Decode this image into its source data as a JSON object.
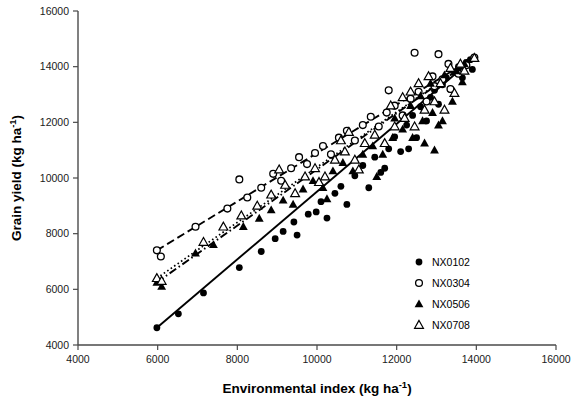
{
  "chart_data": {
    "type": "scatter",
    "title": "",
    "xlabel": "Environmental index (kg ha-1)",
    "xlabel_base": "Environmental index (kg ha",
    "xlabel_sup": "-1",
    "xlabel_tail": ")",
    "ylabel": "Grain yield  (kg ha-1)",
    "ylabel_base": "Grain yield  (kg ha",
    "ylabel_sup": "-1",
    "ylabel_tail": ")",
    "xlim": [
      4000,
      16000
    ],
    "ylim": [
      4000,
      16000
    ],
    "xticks": [
      4000,
      6000,
      8000,
      10000,
      12000,
      14000,
      16000
    ],
    "yticks": [
      4000,
      6000,
      8000,
      10000,
      12000,
      14000,
      16000
    ],
    "xtick_labels": [
      "4000",
      "6000",
      "8000",
      "10000",
      "12000",
      "14000",
      "16000"
    ],
    "ytick_labels": [
      "4000",
      "6000",
      "8000",
      "10000",
      "12000",
      "14000",
      "16000"
    ],
    "grid": false,
    "legend_position": "lower-right",
    "series": [
      {
        "name": "NX0102",
        "marker": "filled-circle",
        "line_style": "solid",
        "fit_line": {
          "x": [
            5980,
            13950
          ],
          "y": [
            4620,
            14320
          ]
        },
        "points": [
          [
            5980,
            4620
          ],
          [
            6520,
            5120
          ],
          [
            7150,
            5870
          ],
          [
            8050,
            6780
          ],
          [
            8600,
            7360
          ],
          [
            8950,
            7820
          ],
          [
            9150,
            8080
          ],
          [
            9420,
            8420
          ],
          [
            9500,
            7950
          ],
          [
            9780,
            8700
          ],
          [
            9980,
            8780
          ],
          [
            10100,
            9150
          ],
          [
            10250,
            8560
          ],
          [
            10450,
            9450
          ],
          [
            10600,
            9700
          ],
          [
            10750,
            9050
          ],
          [
            10950,
            10080
          ],
          [
            11150,
            10450
          ],
          [
            11300,
            9650
          ],
          [
            11450,
            10750
          ],
          [
            11600,
            10200
          ],
          [
            11800,
            11050
          ],
          [
            11950,
            11480
          ],
          [
            12100,
            10950
          ],
          [
            12250,
            11900
          ],
          [
            12400,
            12250
          ],
          [
            12500,
            11450
          ],
          [
            12600,
            12560
          ],
          [
            12750,
            12050
          ],
          [
            12850,
            12900
          ],
          [
            12950,
            13150
          ],
          [
            13050,
            12650
          ],
          [
            13150,
            13350
          ],
          [
            13250,
            13600
          ],
          [
            13350,
            13180
          ],
          [
            13450,
            13800
          ],
          [
            13550,
            14000
          ],
          [
            13650,
            13600
          ],
          [
            13750,
            14150
          ],
          [
            13850,
            14250
          ],
          [
            13950,
            14320
          ],
          [
            13900,
            13900
          ],
          [
            12300,
            11050
          ],
          [
            11700,
            10350
          ]
        ]
      },
      {
        "name": "NX0304",
        "marker": "open-circle",
        "line_style": "dashed",
        "fit_line": {
          "x": [
            5980,
            13950
          ],
          "y": [
            7400,
            14330
          ]
        },
        "points": [
          [
            5980,
            7400
          ],
          [
            6080,
            7180
          ],
          [
            6950,
            8250
          ],
          [
            7750,
            8900
          ],
          [
            8050,
            9950
          ],
          [
            8250,
            9300
          ],
          [
            8600,
            9650
          ],
          [
            8900,
            10150
          ],
          [
            9100,
            9900
          ],
          [
            9350,
            10350
          ],
          [
            9550,
            10750
          ],
          [
            9750,
            10500
          ],
          [
            9950,
            10900
          ],
          [
            10150,
            11150
          ],
          [
            10350,
            10850
          ],
          [
            10550,
            11450
          ],
          [
            10750,
            11700
          ],
          [
            10950,
            11350
          ],
          [
            11150,
            11900
          ],
          [
            11350,
            12200
          ],
          [
            11550,
            11850
          ],
          [
            11750,
            12350
          ],
          [
            11950,
            12600
          ],
          [
            12150,
            12250
          ],
          [
            12350,
            12850
          ],
          [
            12550,
            13100
          ],
          [
            12750,
            12750
          ],
          [
            12950,
            13300
          ],
          [
            13150,
            13550
          ],
          [
            13350,
            13200
          ],
          [
            13550,
            13750
          ],
          [
            13750,
            14050
          ],
          [
            13950,
            14330
          ],
          [
            12450,
            14500
          ],
          [
            13050,
            14450
          ],
          [
            11800,
            13150
          ],
          [
            12900,
            13650
          ],
          [
            13300,
            14100
          ]
        ]
      },
      {
        "name": "NX0506",
        "marker": "filled-triangle",
        "line_style": "dashdot",
        "fit_line": {
          "x": [
            5980,
            13950
          ],
          "y": [
            6250,
            14300
          ]
        },
        "points": [
          [
            5980,
            6250
          ],
          [
            6100,
            6100
          ],
          [
            6950,
            7300
          ],
          [
            7400,
            7600
          ],
          [
            8150,
            8250
          ],
          [
            8550,
            8550
          ],
          [
            8850,
            8850
          ],
          [
            9150,
            9200
          ],
          [
            9400,
            9050
          ],
          [
            9650,
            9600
          ],
          [
            9900,
            9900
          ],
          [
            10150,
            9650
          ],
          [
            10400,
            10250
          ],
          [
            10650,
            10550
          ],
          [
            10900,
            10250
          ],
          [
            11150,
            10850
          ],
          [
            11400,
            11150
          ],
          [
            11650,
            10850
          ],
          [
            11900,
            11450
          ],
          [
            12150,
            11750
          ],
          [
            12400,
            11450
          ],
          [
            12650,
            12050
          ],
          [
            12900,
            12350
          ],
          [
            13150,
            12050
          ],
          [
            13400,
            12750
          ],
          [
            13650,
            13450
          ],
          [
            13950,
            14300
          ],
          [
            11500,
            10050
          ],
          [
            12600,
            12950
          ],
          [
            12850,
            13400
          ],
          [
            13200,
            13700
          ],
          [
            13500,
            13850
          ],
          [
            13700,
            14100
          ],
          [
            12350,
            12600
          ],
          [
            11950,
            12150
          ],
          [
            10250,
            9250
          ],
          [
            12700,
            11250
          ],
          [
            13050,
            11900
          ],
          [
            12950,
            11000
          ]
        ]
      },
      {
        "name": "NX0708",
        "marker": "open-triangle",
        "line_style": "dotted",
        "fit_line": {
          "x": [
            5980,
            13950
          ],
          "y": [
            6400,
            14310
          ]
        },
        "points": [
          [
            5980,
            6400
          ],
          [
            6100,
            6300
          ],
          [
            7150,
            7700
          ],
          [
            7650,
            8250
          ],
          [
            8100,
            8650
          ],
          [
            8500,
            9000
          ],
          [
            8850,
            9400
          ],
          [
            9200,
            9750
          ],
          [
            9450,
            9450
          ],
          [
            9700,
            10050
          ],
          [
            9950,
            10350
          ],
          [
            10200,
            10050
          ],
          [
            10450,
            10650
          ],
          [
            10700,
            10950
          ],
          [
            10950,
            10650
          ],
          [
            11200,
            11250
          ],
          [
            11450,
            11550
          ],
          [
            11700,
            11250
          ],
          [
            11950,
            11850
          ],
          [
            12200,
            12150
          ],
          [
            12450,
            11850
          ],
          [
            12700,
            12450
          ],
          [
            12950,
            12750
          ],
          [
            13200,
            12450
          ],
          [
            13450,
            13050
          ],
          [
            13700,
            13850
          ],
          [
            13950,
            14310
          ],
          [
            9050,
            10300
          ],
          [
            10050,
            9850
          ],
          [
            11050,
            10300
          ],
          [
            12350,
            13100
          ],
          [
            12550,
            13400
          ],
          [
            12800,
            13650
          ],
          [
            13100,
            13400
          ],
          [
            13350,
            13950
          ],
          [
            13600,
            14100
          ],
          [
            11850,
            12600
          ],
          [
            12150,
            12900
          ],
          [
            10800,
            11650
          ],
          [
            10600,
            11350
          ]
        ]
      }
    ]
  },
  "legend": {
    "items": [
      {
        "label": "NX0102",
        "marker": "filled-circle"
      },
      {
        "label": "NX0304",
        "marker": "open-circle"
      },
      {
        "label": "NX0506",
        "marker": "filled-triangle"
      },
      {
        "label": "NX0708",
        "marker": "open-triangle"
      }
    ]
  }
}
